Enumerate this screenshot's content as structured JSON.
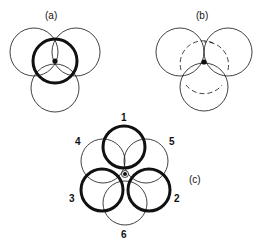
{
  "panels": {
    "a": {
      "label": "(a)"
    },
    "b": {
      "label": "(b)"
    },
    "c": {
      "label": "(c)",
      "circle_labels": [
        "1",
        "2",
        "3",
        "4",
        "5",
        "6"
      ]
    }
  },
  "colors": {
    "stroke": "#111111",
    "background": "#ffffff"
  }
}
